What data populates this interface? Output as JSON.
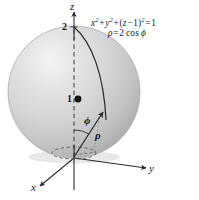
{
  "figure": {
    "background_color": "#ffffff",
    "sphere": {
      "fill_light": "#f2f2f2",
      "fill_mid": "#d2d2d2",
      "fill_dark": "#b4b4b4",
      "outline_color": "#9a9a9a",
      "center_px": {
        "x": 74,
        "y": 92
      },
      "radius_px": 66
    },
    "line_color": "#2b2b2b"
  },
  "equations": {
    "line1": {
      "x_term": "x",
      "x_exp": "2",
      "plus1": "+",
      "y_term": "y",
      "y_exp": "2",
      "plus2": "+",
      "open": "(",
      "z_term": "z",
      "minus": "−",
      "one": "1",
      "close": ")",
      "group_exp": "2",
      "equals": "=",
      "rhs": "1"
    },
    "line2": {
      "rho": "ρ",
      "equals": "=",
      "coef": "2",
      "cos": "cos",
      "phi": "ϕ"
    }
  },
  "axes": {
    "z_label": "z",
    "y_label": "y",
    "x_label": "x"
  },
  "annotations": {
    "top_value": "2",
    "center_value": "1",
    "phi_label": "ϕ",
    "rho_label": "ρ"
  }
}
